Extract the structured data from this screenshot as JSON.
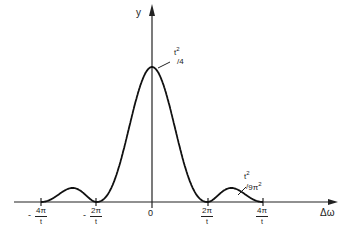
{
  "chart_data": {
    "type": "line",
    "title": "",
    "xlabel": "Δω",
    "ylabel": "y",
    "function": "sinc-squared: y = (t^2/4)·[sin(Δω t/2)/(Δω t/2)]^2",
    "x_ticks": [
      {
        "label_num": "4π",
        "label_den": "t",
        "sign": "-",
        "value": "-4π/t"
      },
      {
        "label_num": "2π",
        "label_den": "t",
        "sign": "-",
        "value": "-2π/t"
      },
      {
        "label": "0",
        "value": "0"
      },
      {
        "label_num": "2π",
        "label_den": "t",
        "sign": "",
        "value": "2π/t"
      },
      {
        "label_num": "4π",
        "label_den": "t",
        "sign": "",
        "value": "4π/t"
      }
    ],
    "annotations": [
      {
        "text": "t²/4",
        "num": "t",
        "num_exp": "2",
        "den": "4",
        "points_to": "central peak at Δω=0"
      },
      {
        "text": "t²/9π²",
        "num": "t",
        "num_exp": "2",
        "den": "9π",
        "den_exp": "2",
        "points_to": "first side lobe near Δω=3π/t"
      }
    ],
    "x": [
      "-4π/t",
      "-3π/t",
      "-2π/t",
      "-π/t",
      "0",
      "π/t",
      "2π/t",
      "3π/t",
      "4π/t"
    ],
    "values": [
      "0",
      "t²/(9π²)",
      "0",
      "t²/π²",
      "t²/4",
      "t²/π²",
      "0",
      "t²/(9π²)",
      "0"
    ],
    "grid": false,
    "legend": null
  },
  "labels": {
    "y_axis": "y",
    "x_axis": "Δω",
    "zero": "0",
    "minus": "-",
    "tick_m4_num": "4π",
    "tick_m4_den": "t",
    "tick_m2_num": "2π",
    "tick_m2_den": "t",
    "tick_p2_num": "2π",
    "tick_p2_den": "t",
    "tick_p4_num": "4π",
    "tick_p4_den": "t",
    "peak_num": "t",
    "peak_exp": "2",
    "peak_den": "4",
    "lobe_num": "t",
    "lobe_exp": "2",
    "lobe_den": "9π",
    "lobe_den_exp": "2"
  }
}
